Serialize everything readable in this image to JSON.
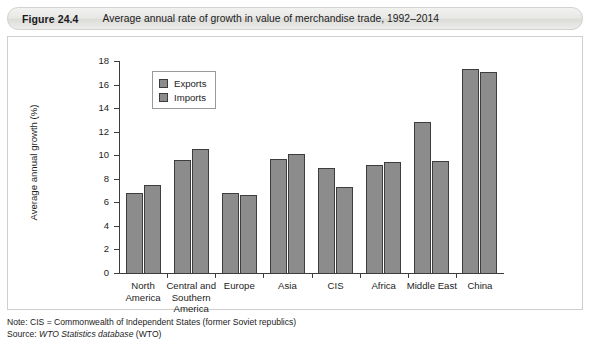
{
  "figure": {
    "number": "Figure 24.4",
    "caption": "Average annual rate of growth in value of merchandise trade, 1992–2014"
  },
  "footnotes": {
    "note_prefix": "Note: CIS = Commonwealth of Independent States (former Soviet republics)",
    "source_prefix": "Source: ",
    "source_italic": "WTO Statistics database",
    "source_suffix": " (WTO)"
  },
  "colors": {
    "bar_fill": "#8c8c8c",
    "bar_outline": "#3d3d3d",
    "axis": "#3c3c3c",
    "panel_background": "#ffffff",
    "header_background": "#e8e8e6",
    "text": "#1d1d1d"
  },
  "chart_data": {
    "type": "bar",
    "title": "Average annual rate of growth in value of merchandise trade, 1992–2014",
    "xlabel": "",
    "ylabel": "Average annual growth (%)",
    "ylim": [
      0,
      18
    ],
    "yticks": [
      0,
      2,
      4,
      6,
      8,
      10,
      12,
      14,
      16,
      18
    ],
    "grid": false,
    "legend_position": "top-left-inside",
    "categories": [
      "North\nAmerica",
      "Central and\nSouthern\nAmerica",
      "Europe",
      "Asia",
      "CIS",
      "Africa",
      "Middle East",
      "China"
    ],
    "series": [
      {
        "name": "Exports",
        "values": [
          6.8,
          9.6,
          6.8,
          9.7,
          8.9,
          9.2,
          12.8,
          17.3
        ]
      },
      {
        "name": "Imports",
        "values": [
          7.5,
          10.5,
          6.6,
          10.1,
          7.3,
          9.4,
          9.5,
          17.1
        ]
      }
    ]
  }
}
